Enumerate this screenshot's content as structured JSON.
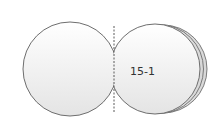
{
  "diagram": {
    "label": "15-1",
    "colors": {
      "stroke": "#6e6e6e",
      "fill_light": "#ffffff",
      "fill_shade": "#e6e6e6",
      "text": "#333333"
    }
  }
}
